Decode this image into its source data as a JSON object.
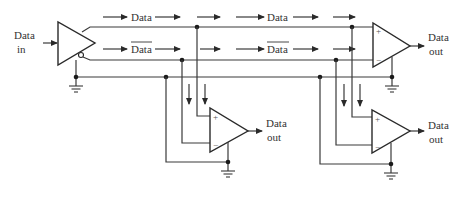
{
  "diagram": {
    "type": "differential-bus-circuit",
    "colors": {
      "line": "#3a3a3a",
      "background": "#ffffff"
    },
    "driver": {
      "input_label_line1": "Data",
      "input_label_line2": "in",
      "outputs": [
        "Data",
        "Data (inverted)"
      ]
    },
    "bus_labels": {
      "top_line_1": "Data",
      "top_line_2": "Data",
      "bottom_line_1": "Data",
      "bottom_line_2": "Data"
    },
    "receivers": [
      {
        "id": "top-right",
        "plus": "+",
        "minus": "−",
        "out_line1": "Data",
        "out_line2": "out"
      },
      {
        "id": "bottom-middle",
        "plus": "+",
        "minus": "−",
        "out_line1": "Data",
        "out_line2": "out"
      },
      {
        "id": "bottom-right",
        "plus": "+",
        "minus": "−",
        "out_line1": "Data",
        "out_line2": "out"
      }
    ]
  }
}
